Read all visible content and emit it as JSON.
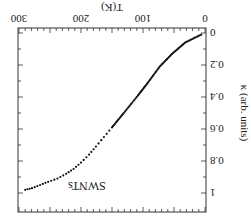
{
  "chart_data": {
    "type": "scatter",
    "title": "",
    "annotation": "SWNTs",
    "xlabel": "T(K)",
    "ylabel": "κ (arb. units)",
    "xlim": [
      0,
      300
    ],
    "ylim": [
      0,
      1
    ],
    "x_ticks": [
      "0",
      "100",
      "200",
      "300"
    ],
    "y_ticks": [
      "0",
      "0.2",
      "0.4",
      "0.6",
      "0.8",
      "1"
    ],
    "grid": false,
    "orientation": "rotated 180 degrees",
    "series": [
      {
        "name": "SWNTs",
        "x": [
          6,
          32,
          53,
          73,
          92,
          108,
          131,
          150,
          163,
          176,
          187,
          200,
          212,
          224,
          238,
          253,
          266,
          279,
          290
        ],
        "y": [
          0.01,
          0.06,
          0.13,
          0.21,
          0.31,
          0.39,
          0.5,
          0.59,
          0.65,
          0.71,
          0.76,
          0.81,
          0.85,
          0.88,
          0.91,
          0.93,
          0.95,
          0.97,
          0.98
        ]
      }
    ]
  }
}
